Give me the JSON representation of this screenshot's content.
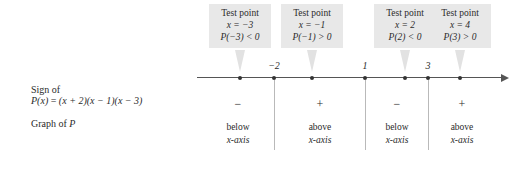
{
  "figure": {
    "type": "sign-chart",
    "polynomial": "P(x) = (x + 2)(x - 1)(x - 3)"
  },
  "row_labels": {
    "sign_of": "Sign of",
    "sign_expression_lhs": "P(x)",
    "sign_expression_eq": "=",
    "sign_expression_rhs": "(x + 2)(x − 1)(x − 3)",
    "graph_of": "Graph of",
    "graph_of_p": "P"
  },
  "test_points": [
    {
      "title": "Test point",
      "x_value": "x = −3",
      "p_value": "P(−3) < 0"
    },
    {
      "title": "Test point",
      "x_value": "x = −1",
      "p_value": "P(−1) > 0"
    },
    {
      "title": "Test point",
      "x_value": "x = 2",
      "p_value": "P(2) < 0"
    },
    {
      "title": "Test point",
      "x_value": "x = 4",
      "p_value": "P(3) > 0"
    }
  ],
  "number_line": {
    "zeros": [
      "−2",
      "1",
      "3"
    ],
    "arrow": "right-arrow"
  },
  "signs": [
    "−",
    "+",
    "−",
    "+"
  ],
  "graph_cells": [
    {
      "position": "below",
      "axis": "x-axis"
    },
    {
      "position": "above",
      "axis": "x-axis"
    },
    {
      "position": "below",
      "axis": "x-axis"
    },
    {
      "position": "above",
      "axis": "x-axis"
    }
  ],
  "colors": {
    "box_fill": "#e8e8e8",
    "axis": "#555555",
    "divider": "#b9b9b9",
    "text": "#2b2b2b"
  }
}
